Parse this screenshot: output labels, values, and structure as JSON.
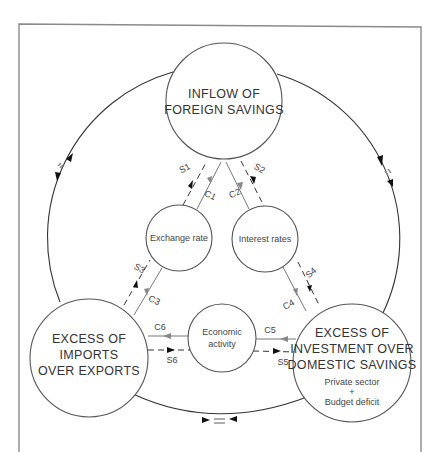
{
  "diagram": {
    "nodes": {
      "foreign_savings": {
        "line1": "INFLOW OF",
        "line2": "FOREIGN SAVINGS"
      },
      "exchange_rate": {
        "label": "Exchange rate"
      },
      "interest_rates": {
        "label": "Interest rates"
      },
      "economic_activity": {
        "line1": "Economic",
        "line2": "activity"
      },
      "imports_exports": {
        "line1": "EXCESS OF",
        "line2": "IMPORTS",
        "line3": "OVER EXPORTS"
      },
      "investment_savings": {
        "line1": "EXCESS OF",
        "line2": "INVESTMENT OVER",
        "line3": "DOMESTIC SAVINGS",
        "sub1": "Private sector",
        "sub2": "+",
        "sub3": "Budget deficit"
      }
    },
    "links": {
      "s1": "S1",
      "c1": "C1",
      "s2": "S2",
      "c2": "C2",
      "s3": "S3",
      "c3": "C3",
      "s4": "S4",
      "c4": "C4",
      "s5": "S5",
      "c5": "C5",
      "s6": "S6",
      "c6": "C6"
    },
    "equality_markers": {
      "left": "=",
      "right": "=",
      "bottom": "="
    },
    "colors": {
      "frame": "#8a8a8a",
      "node_stroke": "#555555",
      "solid_link": "#777777",
      "dashed_link": "#333333"
    }
  }
}
